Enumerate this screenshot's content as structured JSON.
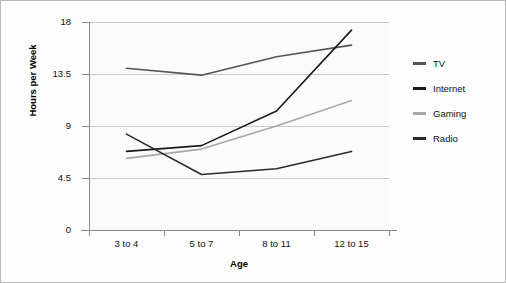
{
  "chart_data": {
    "type": "line",
    "title": "",
    "xlabel": "Age",
    "ylabel": "Hours per Week",
    "categories": [
      "3 to 4",
      "5 to 7",
      "8 to 11",
      "12 to 15"
    ],
    "yticks": [
      0,
      4.5,
      9,
      13.5,
      18
    ],
    "ytick_labels": [
      "0",
      "4.5",
      "9",
      "13.5",
      "18"
    ],
    "ylim": [
      0,
      18
    ],
    "grid": true,
    "legend_position": "right",
    "series": [
      {
        "name": "TV",
        "color": "#555555",
        "values": [
          14.0,
          13.4,
          15.0,
          16.0
        ]
      },
      {
        "name": "Internet",
        "color": "#1a1a1a",
        "values": [
          6.8,
          7.3,
          10.3,
          17.3
        ]
      },
      {
        "name": "Gaming",
        "color": "#a8a8a8",
        "values": [
          6.2,
          7.0,
          9.0,
          11.2
        ]
      },
      {
        "name": "Radio",
        "color": "#2b2b2b",
        "values": [
          8.3,
          4.8,
          5.3,
          6.8
        ]
      }
    ]
  },
  "legend": {
    "items": [
      {
        "label": "TV"
      },
      {
        "label": "Internet"
      },
      {
        "label": "Gaming"
      },
      {
        "label": "Radio"
      }
    ]
  },
  "axes": {
    "x_label": "Age",
    "y_label": "Hours per Week"
  }
}
